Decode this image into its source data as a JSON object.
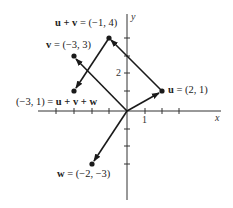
{
  "diagram": {
    "axes": {
      "x_label": "x",
      "y_label": "y",
      "tick_label_x": "1",
      "tick_label_y": "2"
    },
    "vectors": [
      {
        "name": "u",
        "label_bold": "u",
        "label_rest": " = (2, 1)",
        "x": 2,
        "y": 1
      },
      {
        "name": "v",
        "label_bold": "v",
        "label_rest": " = (−3, 3)",
        "x": -3,
        "y": 3
      },
      {
        "name": "w",
        "label_bold": "w",
        "label_rest": " = (−2, −3)",
        "x": -2,
        "y": -3
      },
      {
        "name": "u+v",
        "label_bold": "u + v",
        "label_rest": " = (−1, 4)",
        "x": -1,
        "y": 4
      },
      {
        "name": "u+v+w",
        "label_prefix": "(−3, 1) = ",
        "label_bold": "u + v + w",
        "x": -3,
        "y": 1
      }
    ],
    "colors": {
      "line": "#1a1a1a",
      "text": "#222222"
    }
  }
}
